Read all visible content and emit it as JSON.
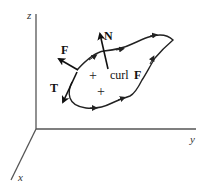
{
  "figure": {
    "axes": {
      "z_label": "z",
      "y_label": "y",
      "x_label": "x"
    },
    "vectors": {
      "normal_label": "N",
      "field_label": "F",
      "tangent_label": "T"
    },
    "curl_label": {
      "prefix": "curl",
      "vector": "F"
    },
    "orientation_marks": [
      "+",
      "+"
    ],
    "colors": {
      "ink": "#111111",
      "axis": "#555555",
      "background": "#ffffff"
    }
  }
}
